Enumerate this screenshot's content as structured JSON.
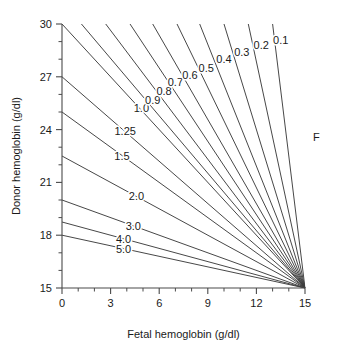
{
  "chart_data": {
    "type": "line",
    "title": "",
    "xlabel": "Fetal hemoglobin (g/dl)",
    "ylabel": "Donor hemoglobin (g/dl)",
    "xlim": [
      0,
      15
    ],
    "ylim": [
      15,
      30
    ],
    "xticks": [
      0,
      3,
      6,
      9,
      12,
      15
    ],
    "xtick_labels": [
      "0",
      "3",
      "6",
      "9",
      "12",
      "15"
    ],
    "yticks": [
      15,
      18,
      21,
      24,
      27,
      30
    ],
    "ytick_labels": [
      "15",
      "18",
      "21",
      "24",
      "27",
      "30"
    ],
    "x_minor_step": 1,
    "y_minor_step": 1,
    "grid": false,
    "legend": "none",
    "convergence_point": [
      15,
      15
    ],
    "annotations": [
      {
        "text": "F",
        "x": 15.7,
        "y": 23.6
      }
    ],
    "series": [
      {
        "name": "5.0",
        "label": "5.0",
        "x": [
          0,
          15
        ],
        "y": [
          18.0,
          15.0
        ],
        "label_x": 3.8,
        "label_y": 17.24
      },
      {
        "name": "4.0",
        "label": "4.0",
        "x": [
          0,
          15
        ],
        "y": [
          18.75,
          15.0
        ],
        "label_x": 3.8,
        "label_y": 17.8
      },
      {
        "name": "3.0",
        "label": "3.0",
        "x": [
          0,
          15
        ],
        "y": [
          20.0,
          15.0
        ],
        "label_x": 4.4,
        "label_y": 18.53
      },
      {
        "name": "2.0",
        "label": "2.0",
        "x": [
          0,
          15
        ],
        "y": [
          22.5,
          15.0
        ],
        "label_x": 4.6,
        "label_y": 20.2
      },
      {
        "name": "1.5",
        "label": "1.5",
        "x": [
          0,
          15
        ],
        "y": [
          25.0,
          15.0
        ],
        "label_x": 3.7,
        "label_y": 22.5
      },
      {
        "name": "1.25",
        "label": "1.25",
        "x": [
          0,
          15
        ],
        "y": [
          27.0,
          15.0
        ],
        "label_x": 3.9,
        "label_y": 23.9
      },
      {
        "name": "1.0",
        "label": "1.0",
        "x": [
          0,
          15
        ],
        "y": [
          30.0,
          15.0
        ],
        "label_x": 4.9,
        "label_y": 25.2
      },
      {
        "name": "0.9",
        "label": "0.9",
        "x": [
          1.2,
          15
        ],
        "y": [
          30.0,
          15.0
        ],
        "label_x": 5.6,
        "label_y": 25.7
      },
      {
        "name": "0.8",
        "label": "0.8",
        "x": [
          2.7,
          15
        ],
        "y": [
          30.0,
          15.0
        ],
        "label_x": 6.3,
        "label_y": 26.2
      },
      {
        "name": "0.7",
        "label": "0.7",
        "x": [
          4.2,
          15
        ],
        "y": [
          30.0,
          15.0
        ],
        "label_x": 7.0,
        "label_y": 26.7
      },
      {
        "name": "0.6",
        "label": "0.6",
        "x": [
          5.6,
          15
        ],
        "y": [
          30.0,
          15.0
        ],
        "label_x": 7.9,
        "label_y": 27.1
      },
      {
        "name": "0.5",
        "label": "0.5",
        "x": [
          7.1,
          15
        ],
        "y": [
          30.0,
          15.0
        ],
        "label_x": 8.9,
        "label_y": 27.5
      },
      {
        "name": "0.4",
        "label": "0.4",
        "x": [
          8.5,
          15
        ],
        "y": [
          30.0,
          15.0
        ],
        "label_x": 10.0,
        "label_y": 28.0
      },
      {
        "name": "0.3",
        "label": "0.3",
        "x": [
          10.0,
          15
        ],
        "y": [
          30.0,
          15.0
        ],
        "label_x": 11.1,
        "label_y": 28.4
      },
      {
        "name": "0.2",
        "label": "0.2",
        "x": [
          11.5,
          15
        ],
        "y": [
          30.0,
          15.0
        ],
        "label_x": 12.3,
        "label_y": 28.8
      },
      {
        "name": "0.1",
        "label": "0.1",
        "x": [
          13.0,
          15
        ],
        "y": [
          30.0,
          15.0
        ],
        "label_x": 13.5,
        "label_y": 29.1
      }
    ]
  },
  "colors": {
    "line": "#3d3d3d",
    "axis": "#4a4a4a",
    "text": "#1a1a1a",
    "background": "#ffffff"
  }
}
